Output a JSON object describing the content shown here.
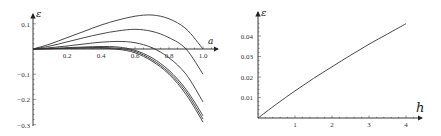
{
  "chart_data": [
    {
      "type": "line",
      "title": "",
      "xlabel": "a",
      "ylabel": "ε",
      "xlim": [
        0,
        1.05
      ],
      "ylim": [
        -0.3,
        0.13
      ],
      "grid": false,
      "legend": "none",
      "x_ticks": [
        "0.2",
        "0.4",
        "0.6",
        "0.8",
        "1.0"
      ],
      "y_ticks": [
        "0.1",
        "-0.1",
        "-0.2",
        "-0.3"
      ],
      "x": [
        0,
        0.1,
        0.2,
        0.3,
        0.4,
        0.5,
        0.6,
        0.7,
        0.8,
        0.9,
        1.0
      ],
      "series": [
        {
          "name": "curve 1",
          "values": [
            0,
            0.02,
            0.045,
            0.07,
            0.095,
            0.115,
            0.13,
            0.135,
            0.12,
            0.08,
            0.0
          ]
        },
        {
          "name": "curve 2",
          "values": [
            0,
            0.012,
            0.028,
            0.045,
            0.06,
            0.072,
            0.078,
            0.07,
            0.045,
            0.0,
            -0.1
          ]
        },
        {
          "name": "curve 3",
          "values": [
            0,
            0.005,
            0.012,
            0.02,
            0.027,
            0.03,
            0.025,
            0.005,
            -0.035,
            -0.1,
            -0.21
          ]
        },
        {
          "name": "curve 4",
          "values": [
            0,
            0.002,
            0.005,
            0.008,
            0.01,
            0.008,
            -0.005,
            -0.035,
            -0.085,
            -0.16,
            -0.265
          ]
        },
        {
          "name": "curve 5",
          "values": [
            0,
            0.001,
            0.003,
            0.005,
            0.006,
            0.003,
            -0.01,
            -0.042,
            -0.093,
            -0.17,
            -0.278
          ]
        },
        {
          "name": "curve 6",
          "values": [
            0,
            0.001,
            0.002,
            0.003,
            0.003,
            -0.001,
            -0.015,
            -0.048,
            -0.1,
            -0.18,
            -0.29
          ]
        }
      ]
    },
    {
      "type": "line",
      "title": "",
      "xlabel": "h",
      "ylabel": "ε",
      "xlim": [
        0,
        4.4
      ],
      "ylim": [
        0,
        0.048
      ],
      "grid": false,
      "legend": "none",
      "x_ticks": [
        "1",
        "2",
        "3",
        "4"
      ],
      "y_ticks": [
        "0.01",
        "0.02",
        "0.03",
        "0.04"
      ],
      "x": [
        0,
        0.5,
        1,
        1.5,
        2,
        2.5,
        3,
        3.5,
        4
      ],
      "series": [
        {
          "name": "epsilon(h)",
          "values": [
            0,
            0.0068,
            0.0132,
            0.0193,
            0.025,
            0.0306,
            0.036,
            0.041,
            0.046
          ]
        }
      ]
    }
  ]
}
